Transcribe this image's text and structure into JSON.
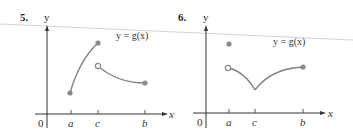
{
  "panels": [
    {
      "number": "5.",
      "y_label": "y",
      "x_label": "x",
      "origin_label": "0",
      "equation": "y = g(x)",
      "ticks": [
        "a",
        "c",
        "b"
      ]
    },
    {
      "number": "6.",
      "y_label": "y",
      "x_label": "x",
      "origin_label": "0",
      "equation": "y = g(x)",
      "ticks": [
        "a",
        "c",
        "b"
      ]
    }
  ],
  "colors": {
    "axis": "#333333",
    "curve": "#808080",
    "dot": "#8a8a8a"
  }
}
